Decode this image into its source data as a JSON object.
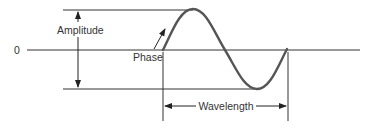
{
  "diagram": {
    "type": "sine-wave-anatomy",
    "labels": {
      "zero": "0",
      "amplitude": "Amplitude",
      "phase": "Phase",
      "wavelength": "Wavelength"
    },
    "colors": {
      "wave": "#555555",
      "lines": "#333333",
      "text": "#333333"
    }
  }
}
